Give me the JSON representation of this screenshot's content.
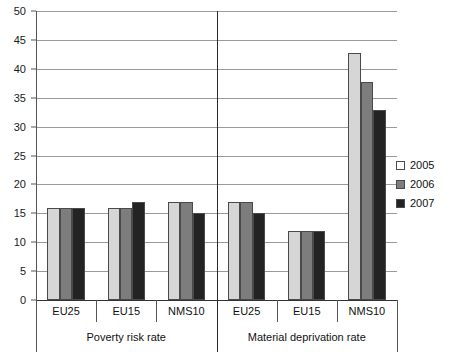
{
  "chart_data": {
    "type": "bar",
    "title": "",
    "subtitle": "",
    "xlabel": "",
    "ylabel": "",
    "ylim": [
      0,
      50
    ],
    "ytick_step": 5,
    "yticks": [
      0,
      5,
      10,
      15,
      20,
      25,
      30,
      35,
      40,
      45,
      50
    ],
    "ytick_labels": [
      "0",
      "5",
      "10",
      "15",
      "20",
      "25",
      "30",
      "35",
      "40",
      "45",
      "50"
    ],
    "grid": true,
    "legend_position": "right",
    "categories": [
      "EU25",
      "EU15",
      "NMS10",
      "EU25",
      "EU15",
      "NMS10"
    ],
    "groups": [
      {
        "label": "Poverty risk rate",
        "categories": [
          "EU25",
          "EU15",
          "NMS10"
        ]
      },
      {
        "label": "Material deprivation rate",
        "categories": [
          "EU25",
          "EU15",
          "NMS10"
        ]
      }
    ],
    "series": [
      {
        "name": "2005",
        "color": "#d6d6d6",
        "values": [
          16,
          16,
          17,
          17,
          12,
          42.8
        ]
      },
      {
        "name": "2006",
        "color": "#7d7d7d",
        "values": [
          16,
          16,
          17,
          17,
          12,
          37.8
        ]
      },
      {
        "name": "2007",
        "color": "#232323",
        "values": [
          16,
          17,
          15,
          15,
          12,
          32.8
        ]
      }
    ],
    "legend": [
      {
        "label": "2005",
        "color": "#d6d6d6"
      },
      {
        "label": "2006",
        "color": "#7d7d7d"
      },
      {
        "label": "2007",
        "color": "#232323"
      }
    ]
  }
}
